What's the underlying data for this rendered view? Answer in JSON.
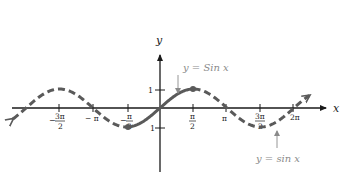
{
  "chart_data": {
    "type": "line",
    "title": "",
    "xlabel": "x",
    "ylabel": "y",
    "x_ticks": [
      "-3π/2",
      "-π",
      "-π/2",
      "π/2",
      "π",
      "3π/2",
      "2π"
    ],
    "y_ticks": [
      "1",
      "-1"
    ],
    "xlim": [
      -7.3,
      7.0
    ],
    "ylim": [
      -2.9,
      3.7
    ],
    "grid": false,
    "series": [
      {
        "name": "y = sin x",
        "style": "dashed",
        "domain": [
          -6.9,
          7.0
        ],
        "function": "sin(x)",
        "x": [
          -4.712,
          -3.1416,
          -1.5708,
          0,
          1.5708,
          3.1416,
          4.712,
          6.2832
        ],
        "y": [
          1,
          0,
          -1,
          0,
          1,
          0,
          -1,
          0
        ]
      },
      {
        "name": "y = Sin x",
        "style": "solid",
        "domain": [
          -1.5708,
          1.5708
        ],
        "function": "sin(x) restricted to [-π/2, π/2]",
        "x": [
          -1.5708,
          0,
          1.5708
        ],
        "y": [
          -1,
          0,
          1
        ],
        "endpoints": "closed dots"
      }
    ],
    "annotations": [
      {
        "text": "y = Sin x",
        "points_to": "restricted solid segment near x = π/4"
      },
      {
        "text": "y = sin x",
        "points_to": "dashed curve near x = 3π/2"
      }
    ]
  },
  "labels": {
    "x_axis": "x",
    "y_axis": "y",
    "tick_neg_3pi_2_num": "3π",
    "tick_neg_3pi_2_den": "2",
    "tick_neg_pi": "− π",
    "tick_neg_pi_2_num": "π",
    "tick_neg_pi_2_den": "2",
    "tick_pi_2_num": "π",
    "tick_pi_2_den": "2",
    "tick_pi": "π",
    "tick_3pi_2_num": "3π",
    "tick_3pi_2_den": "2",
    "tick_2pi": "2π",
    "y_tick_1": "1",
    "y_tick_neg1": "1",
    "annotation_restricted": "y = Sin x",
    "annotation_full": "y = sin x"
  },
  "colors": {
    "axis": "#1a1a1a",
    "curve": "#5a5a5a",
    "annotation": "#8a8a8a"
  }
}
